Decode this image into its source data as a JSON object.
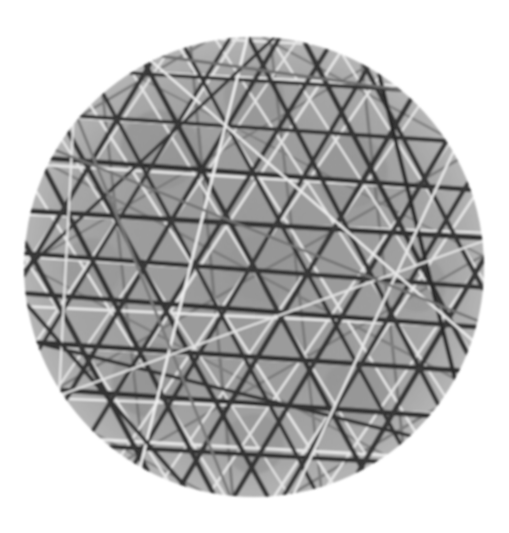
{
  "image": {
    "title": "Circular lattice-line micrograph",
    "width": 509,
    "height": 533,
    "background_color": "#ffffff",
    "alt_text": "Grayscale circular disk crossed by many straight dark and light lines forming a triangular lattice"
  },
  "disk": {
    "label": "circular specimen disk",
    "center_x": 254,
    "center_y": 267,
    "radius": 230,
    "fill_color": "#9a9a9a",
    "rim_color": "#b4b4b4",
    "inner_shade_color": "#8e8e8e",
    "edge_softness_px": 2
  },
  "palette": {
    "dark_line": "#272727",
    "dark_line_soft": "#3c3c3c",
    "mid_line": "#6d6d6d",
    "light_line": "#efefef",
    "light_line_soft": "#d8d8d8",
    "grain_dark": "#7f7f7f",
    "grain_light": "#ababab"
  },
  "line_families": [
    {
      "name": "family-horizontal",
      "angle_deg": 3.5,
      "spacing_px": 46,
      "tone": "dark",
      "color": "#272727",
      "width_px": 4.6,
      "count": 11
    },
    {
      "name": "family-left-diagonal",
      "angle_deg": 62,
      "spacing_px": 48,
      "tone": "dark",
      "color": "#2b2b2b",
      "width_px": 4.4,
      "count": 11
    },
    {
      "name": "family-right-diagonal",
      "angle_deg": 121,
      "spacing_px": 48,
      "tone": "dark",
      "color": "#2e2e2e",
      "width_px": 4.4,
      "count": 11
    },
    {
      "name": "family-horizontal-light",
      "angle_deg": 3.0,
      "spacing_px": 46,
      "tone": "light",
      "color": "#efefef",
      "width_px": 2.4,
      "count": 11
    },
    {
      "name": "family-left-light",
      "angle_deg": 58,
      "spacing_px": 47,
      "tone": "light",
      "color": "#ececec",
      "width_px": 2.3,
      "count": 11
    },
    {
      "name": "family-right-light",
      "angle_deg": 124,
      "spacing_px": 47,
      "tone": "light",
      "color": "#eaeaea",
      "width_px": 2.3,
      "count": 11
    },
    {
      "name": "family-steep-mid",
      "angle_deg": 84,
      "spacing_px": 92,
      "tone": "mid",
      "color": "#6d6d6d",
      "width_px": 3.0,
      "count": 6
    },
    {
      "name": "family-shallow-mid",
      "angle_deg": 28,
      "spacing_px": 108,
      "tone": "mid",
      "color": "#757575",
      "width_px": 2.6,
      "count": 5
    },
    {
      "name": "family-counter-mid",
      "angle_deg": 150,
      "spacing_px": 112,
      "tone": "mid",
      "color": "#717171",
      "width_px": 2.6,
      "count": 5
    }
  ],
  "stray_lines": [
    {
      "name": "stray-1",
      "angle_deg": 76,
      "offset_px": -168,
      "tone": "dark",
      "color": "#2a2a2a",
      "width_px": 4.2
    },
    {
      "name": "stray-2",
      "angle_deg": 14,
      "offset_px": 126,
      "tone": "dark",
      "color": "#303030",
      "width_px": 3.6
    },
    {
      "name": "stray-3",
      "angle_deg": 104,
      "offset_px": 62,
      "tone": "light",
      "color": "#f2f2f2",
      "width_px": 2.6
    },
    {
      "name": "stray-4",
      "angle_deg": 41,
      "offset_px": -88,
      "tone": "light",
      "color": "#ededed",
      "width_px": 2.4
    },
    {
      "name": "stray-5",
      "angle_deg": 137,
      "offset_px": 154,
      "tone": "dark",
      "color": "#343434",
      "width_px": 3.4
    },
    {
      "name": "stray-6",
      "angle_deg": 93,
      "offset_px": 188,
      "tone": "light",
      "color": "#e6e6e6",
      "width_px": 2.2
    },
    {
      "name": "stray-7",
      "angle_deg": 8,
      "offset_px": -196,
      "tone": "mid",
      "color": "#6a6a6a",
      "width_px": 3.0
    },
    {
      "name": "stray-8",
      "angle_deg": 68,
      "offset_px": 108,
      "tone": "mid",
      "color": "#747474",
      "width_px": 2.8
    },
    {
      "name": "stray-9",
      "angle_deg": 115,
      "offset_px": -132,
      "tone": "light",
      "color": "#e9e9e9",
      "width_px": 2.5
    },
    {
      "name": "stray-10",
      "angle_deg": 49,
      "offset_px": 196,
      "tone": "dark",
      "color": "#2f2f2f",
      "width_px": 3.8
    },
    {
      "name": "stray-11",
      "angle_deg": 160,
      "offset_px": -54,
      "tone": "light",
      "color": "#e4e4e4",
      "width_px": 2.2
    },
    {
      "name": "stray-12",
      "angle_deg": 22,
      "offset_px": -34,
      "tone": "mid",
      "color": "#6f6f6f",
      "width_px": 2.6
    }
  ],
  "blobs": [
    {
      "name": "blob-center",
      "cx": 262,
      "cy": 268,
      "r": 34,
      "color": "#939393"
    },
    {
      "name": "blob-upper-left",
      "cx": 160,
      "cy": 150,
      "r": 40,
      "color": "#909090"
    },
    {
      "name": "blob-upper-right",
      "cx": 352,
      "cy": 172,
      "r": 36,
      "color": "#929292"
    },
    {
      "name": "blob-lower-left",
      "cx": 150,
      "cy": 380,
      "r": 38,
      "color": "#8f8f8f"
    },
    {
      "name": "blob-lower-right",
      "cx": 356,
      "cy": 392,
      "r": 34,
      "color": "#919191"
    },
    {
      "name": "blob-mid-left",
      "cx": 92,
      "cy": 268,
      "r": 30,
      "color": "#949494"
    },
    {
      "name": "blob-mid-right",
      "cx": 418,
      "cy": 284,
      "r": 28,
      "color": "#959595"
    },
    {
      "name": "blob-top",
      "cx": 254,
      "cy": 96,
      "r": 30,
      "color": "#939393"
    },
    {
      "name": "blob-bottom",
      "cx": 254,
      "cy": 444,
      "r": 30,
      "color": "#929292"
    }
  ]
}
